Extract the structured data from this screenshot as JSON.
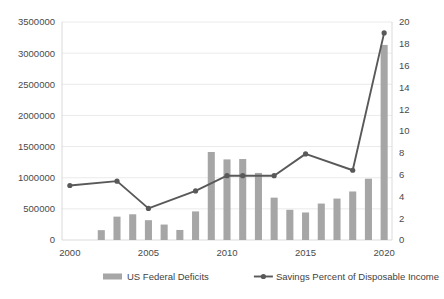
{
  "chart_data": {
    "type": "bar",
    "title": "",
    "subtitle": "",
    "xlabel": "",
    "ylabel": "",
    "grid": true,
    "legend_position": "bottom",
    "categories": [
      "2000",
      "2001",
      "2002",
      "2003",
      "2004",
      "2005",
      "2006",
      "2007",
      "2008",
      "2009",
      "2010",
      "2011",
      "2012",
      "2013",
      "2014",
      "2015",
      "2016",
      "2017",
      "2018",
      "2019",
      "2020"
    ],
    "x_tick_labels": [
      "2000",
      "2005",
      "2010",
      "2015",
      "2020"
    ],
    "x_tick_categories": [
      "2000",
      "2005",
      "2010",
      "2015",
      "2020"
    ],
    "axes": {
      "left": {
        "label": "",
        "min": 0,
        "max": 3500000,
        "step": 500000,
        "tick_labels": [
          "0",
          "500000",
          "1000000",
          "1500000",
          "2000000",
          "2500000",
          "3000000",
          "3500000"
        ],
        "series": "US Federal Deficits"
      },
      "right": {
        "label": "",
        "min": 0,
        "max": 20,
        "step": 2,
        "tick_labels": [
          "0",
          "2",
          "4",
          "6",
          "8",
          "10",
          "12",
          "14",
          "16",
          "18",
          "20"
        ],
        "series": "Savings Percent of Disposable Income"
      }
    },
    "series": [
      {
        "name": "US Federal Deficits",
        "type": "bar",
        "axis": "left",
        "color": "#a6a6a6",
        "values": [
          0,
          0,
          158000,
          375000,
          413000,
          318000,
          248000,
          161000,
          459000,
          1413000,
          1294000,
          1300000,
          1077000,
          680000,
          485000,
          442000,
          585000,
          665000,
          779000,
          984000,
          3132000
        ]
      },
      {
        "name": "Savings Percent of Disposable Income",
        "type": "line",
        "axis": "right",
        "color": "#595959",
        "x": [
          "2000",
          "2003",
          "2005",
          "2008",
          "2010",
          "2011",
          "2013",
          "2015",
          "2018",
          "2020"
        ],
        "values": [
          5.0,
          5.4,
          2.9,
          4.5,
          5.9,
          5.9,
          5.9,
          7.9,
          6.4,
          19.0
        ]
      }
    ],
    "legend": [
      {
        "label": "US Federal Deficits",
        "marker": "bar-swatch",
        "color": "#a6a6a6"
      },
      {
        "label": "Savings Percent of Disposable Income",
        "marker": "line-with-dot",
        "color": "#595959"
      }
    ]
  }
}
